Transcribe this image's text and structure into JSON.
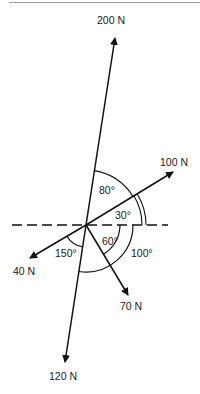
{
  "diagram": {
    "type": "force-diagram",
    "origin": {
      "x": 86,
      "y": 225
    },
    "forces": [
      {
        "label": "200 N",
        "tip": [
          115,
          38
        ],
        "label_pos": [
          97,
          24
        ]
      },
      {
        "label": "100 N",
        "tip": [
          173,
          172
        ],
        "label_pos": [
          160,
          166
        ]
      },
      {
        "label": "40 N",
        "tip": [
          30,
          258
        ],
        "label_pos": [
          13,
          275
        ]
      },
      {
        "label": "70 N",
        "tip": [
          128,
          295
        ],
        "label_pos": [
          120,
          310
        ]
      },
      {
        "label": "120 N",
        "tip": [
          65,
          362
        ],
        "label_pos": [
          49,
          380
        ]
      }
    ],
    "angles": [
      {
        "label": "80°",
        "label_pos": [
          99,
          194
        ]
      },
      {
        "label": "30°",
        "label_pos": [
          115,
          219
        ]
      },
      {
        "label": "60°",
        "label_pos": [
          102,
          245
        ]
      },
      {
        "label": "150°",
        "label_pos": [
          55,
          257
        ]
      },
      {
        "label": "100°",
        "label_pos": [
          131,
          257
        ]
      }
    ],
    "reference_line": "dashed horizontal",
    "stroke_color": "#111111"
  }
}
